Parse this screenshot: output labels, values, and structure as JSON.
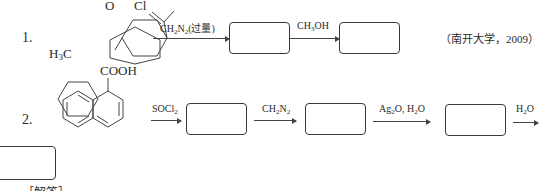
{
  "problems": [
    {
      "number": "1.",
      "molecule": {
        "name": "4-methylcyclohexanecarbonyl chloride",
        "labels": {
          "oxygen": "O",
          "chlorine": "Cl",
          "methyl": "H3C"
        }
      },
      "steps": [
        {
          "reagent": "CH2N2(过量)"
        },
        {
          "reagent": "CH3OH"
        }
      ],
      "source": "（南开大学，2009）"
    },
    {
      "number": "2.",
      "molecule": {
        "name": "1-naphthoic acid",
        "labels": {
          "group": "COOH"
        }
      },
      "steps": [
        {
          "reagent": "SOCl2"
        },
        {
          "reagent": "CH2N2"
        },
        {
          "reagent": "Ag2O, H2O"
        },
        {
          "reagent": "H2O"
        }
      ]
    }
  ],
  "footer": {
    "heading": "［解答］"
  }
}
